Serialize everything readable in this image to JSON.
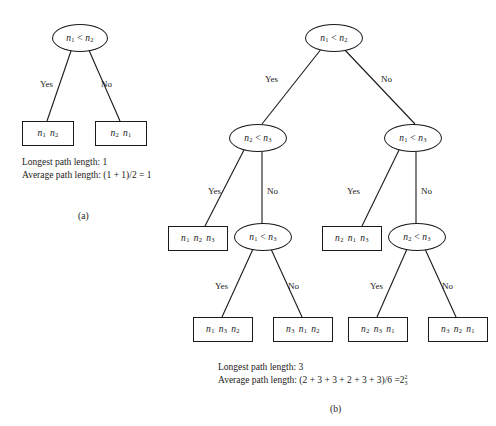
{
  "figure": {
    "type": "decision-tree-diagram",
    "caption_a": "(a)",
    "caption_b": "(b)",
    "ink_color": "#1a1a1a",
    "background_color": "#ffffff"
  },
  "tree_a": {
    "root": {
      "left_var": "n",
      "left_sub": "1",
      "op": "<",
      "right_var": "n",
      "right_sub": "2"
    },
    "edges": {
      "yes": "Yes",
      "no": "No"
    },
    "leaves": [
      {
        "id": "a-leaf-left",
        "items": [
          {
            "v": "n",
            "s": "1"
          },
          {
            "v": "n",
            "s": "2"
          }
        ]
      },
      {
        "id": "a-leaf-right",
        "items": [
          {
            "v": "n",
            "s": "2"
          },
          {
            "v": "n",
            "s": "1"
          }
        ]
      }
    ],
    "stats": {
      "longest_label": "Longest path length:",
      "longest_value": "1",
      "average_label": "Average path length:",
      "average_expr": "(1 + 1)/2 = 1"
    }
  },
  "tree_b": {
    "root": {
      "left_var": "n",
      "left_sub": "1",
      "op": "<",
      "right_var": "n",
      "right_sub": "2"
    },
    "internal_nodes": [
      {
        "id": "b-node-L",
        "left_var": "n",
        "left_sub": "2",
        "op": "<",
        "right_var": "n",
        "right_sub": "3"
      },
      {
        "id": "b-node-R",
        "left_var": "n",
        "left_sub": "1",
        "op": "<",
        "right_var": "n",
        "right_sub": "3"
      },
      {
        "id": "b-node-LR",
        "left_var": "n",
        "left_sub": "1",
        "op": "<",
        "right_var": "n",
        "right_sub": "3"
      },
      {
        "id": "b-node-RR",
        "left_var": "n",
        "left_sub": "2",
        "op": "<",
        "right_var": "n",
        "right_sub": "3"
      }
    ],
    "edges": {
      "yes": "Yes",
      "no": "No"
    },
    "leaves": [
      {
        "id": "b-leaf-1",
        "items": [
          {
            "v": "n",
            "s": "1"
          },
          {
            "v": "n",
            "s": "2"
          },
          {
            "v": "n",
            "s": "3"
          }
        ]
      },
      {
        "id": "b-leaf-2",
        "items": [
          {
            "v": "n",
            "s": "2"
          },
          {
            "v": "n",
            "s": "1"
          },
          {
            "v": "n",
            "s": "3"
          }
        ]
      },
      {
        "id": "b-leaf-3",
        "items": [
          {
            "v": "n",
            "s": "1"
          },
          {
            "v": "n",
            "s": "3"
          },
          {
            "v": "n",
            "s": "2"
          }
        ]
      },
      {
        "id": "b-leaf-4",
        "items": [
          {
            "v": "n",
            "s": "3"
          },
          {
            "v": "n",
            "s": "1"
          },
          {
            "v": "n",
            "s": "2"
          }
        ]
      },
      {
        "id": "b-leaf-5",
        "items": [
          {
            "v": "n",
            "s": "2"
          },
          {
            "v": "n",
            "s": "3"
          },
          {
            "v": "n",
            "s": "1"
          }
        ]
      },
      {
        "id": "b-leaf-6",
        "items": [
          {
            "v": "n",
            "s": "3"
          },
          {
            "v": "n",
            "s": "2"
          },
          {
            "v": "n",
            "s": "1"
          }
        ]
      }
    ],
    "stats": {
      "longest_label": "Longest path length:",
      "longest_value": "3",
      "average_label": "Average path length:",
      "average_expr": "(2 + 3 + 3 + 2 + 3 + 3)/6 =",
      "average_result_whole": "2",
      "average_result_num": "2",
      "average_result_den": "3"
    }
  }
}
